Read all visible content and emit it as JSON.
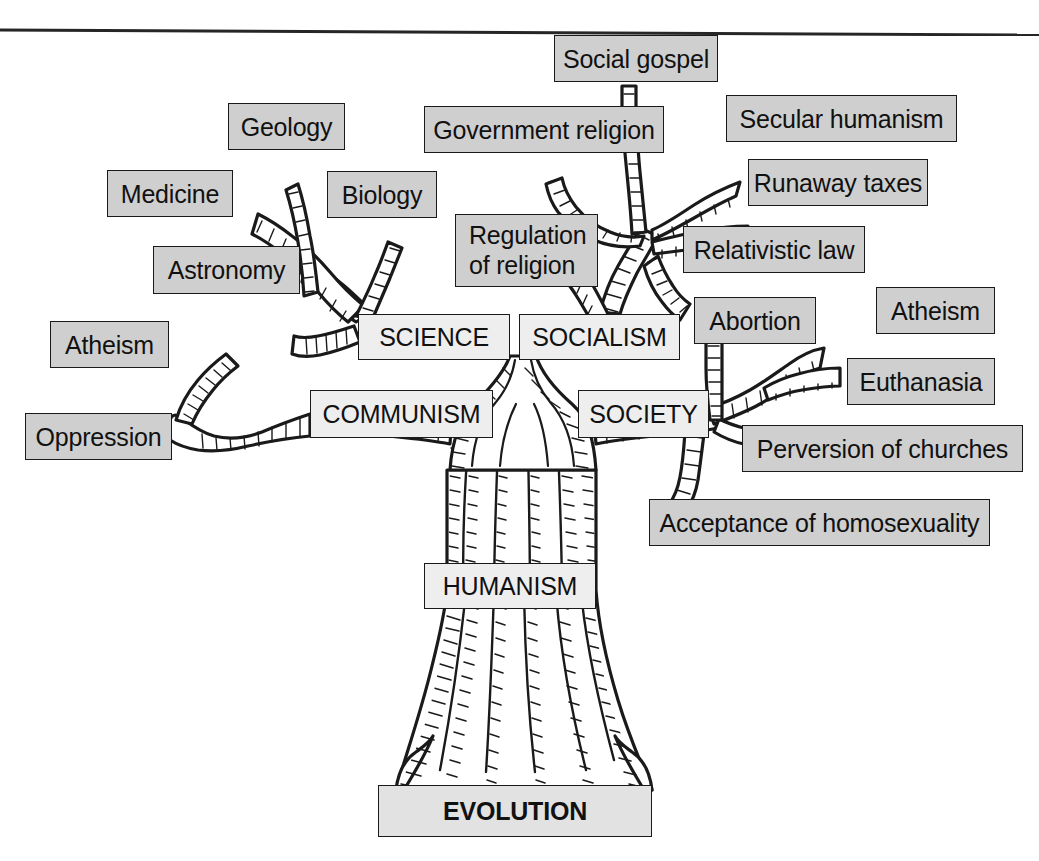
{
  "figure": {
    "kind": "evolution-tree-diagram",
    "title_bar": "horizontal-rule",
    "background_color": "#ffffff",
    "ink_color": "#1a1a1a",
    "leaf_box_fill": "#cfcfcf",
    "node_box_fill": "#eeeeee",
    "root_box_fill": "#e2e2e2"
  },
  "root": {
    "label": "EVOLUTION",
    "x": 378,
    "y": 785,
    "w": 274,
    "h": 52,
    "style": "root"
  },
  "trunk": {
    "label": "HUMANISM",
    "x": 424,
    "y": 563,
    "w": 172,
    "h": 46,
    "style": "node"
  },
  "branches": [
    {
      "name": "science",
      "label": "SCIENCE",
      "x": 358,
      "y": 314,
      "w": 152,
      "h": 46,
      "style": "node",
      "leaves": [
        {
          "label": "Geology",
          "x": 228,
          "y": 103,
          "w": 117,
          "h": 47
        },
        {
          "label": "Medicine",
          "x": 107,
          "y": 170,
          "w": 126,
          "h": 47
        },
        {
          "label": "Biology",
          "x": 327,
          "y": 171,
          "w": 110,
          "h": 47
        },
        {
          "label": "Astronomy",
          "x": 153,
          "y": 246,
          "w": 147,
          "h": 48
        }
      ]
    },
    {
      "name": "communism",
      "label": "COMMUNISM",
      "x": 310,
      "y": 390,
      "w": 183,
      "h": 48,
      "style": "node",
      "leaves": [
        {
          "label": "Atheism",
          "x": 50,
          "y": 321,
          "w": 119,
          "h": 47
        },
        {
          "label": "Oppression",
          "x": 25,
          "y": 413,
          "w": 147,
          "h": 47
        }
      ]
    },
    {
      "name": "socialism",
      "label": "SOCIALISM",
      "x": 519,
      "y": 314,
      "w": 161,
      "h": 46,
      "style": "node",
      "leaves": [
        {
          "label": "Social gospel",
          "x": 554,
          "y": 35,
          "w": 164,
          "h": 47
        },
        {
          "label": "Government religion",
          "x": 424,
          "y": 106,
          "w": 240,
          "h": 47
        },
        {
          "label": "Secular humanism",
          "x": 726,
          "y": 95,
          "w": 231,
          "h": 47
        },
        {
          "label": "Runaway taxes",
          "x": 748,
          "y": 159,
          "w": 180,
          "h": 47
        },
        {
          "label": "Regulation\nof religion",
          "x": 455,
          "y": 214,
          "w": 143,
          "h": 73,
          "two_line": true
        },
        {
          "label": "Relativistic law",
          "x": 683,
          "y": 226,
          "w": 182,
          "h": 47
        }
      ]
    },
    {
      "name": "society",
      "label": "SOCIETY",
      "x": 578,
      "y": 390,
      "w": 131,
      "h": 48,
      "style": "node",
      "leaves": [
        {
          "label": "Abortion",
          "x": 694,
          "y": 297,
          "w": 122,
          "h": 47
        },
        {
          "label": "Atheism",
          "x": 876,
          "y": 287,
          "w": 119,
          "h": 47
        },
        {
          "label": "Euthanasia",
          "x": 847,
          "y": 358,
          "w": 148,
          "h": 47
        },
        {
          "label": "Perversion of churches",
          "x": 742,
          "y": 425,
          "w": 281,
          "h": 47
        },
        {
          "label": "Acceptance of homosexuality",
          "x": 649,
          "y": 499,
          "w": 341,
          "h": 47
        }
      ]
    }
  ]
}
